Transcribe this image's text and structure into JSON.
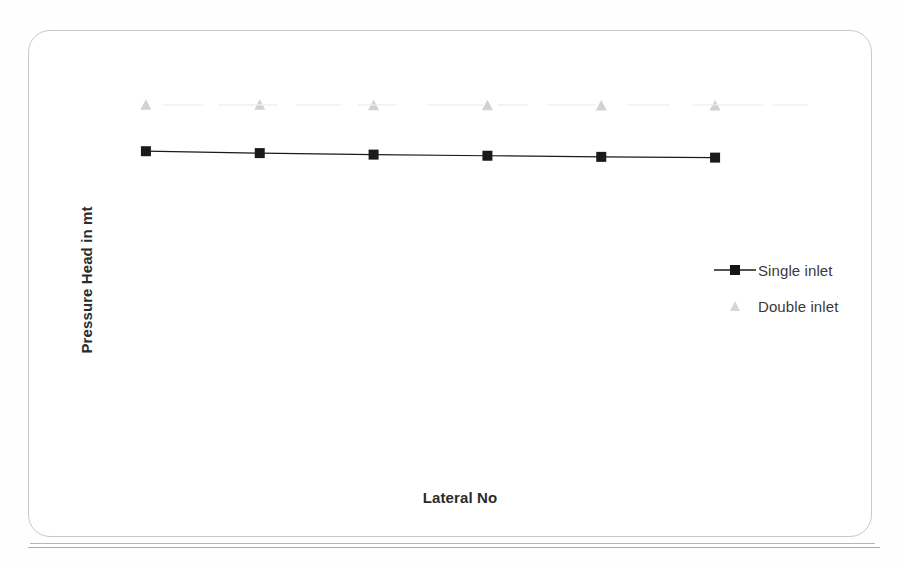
{
  "figure": {
    "frame_color": "#c9c9cb",
    "background": "#ffffff"
  },
  "chart_data": {
    "type": "line",
    "title": "",
    "subtitle": "",
    "xlabel": "Lateral No",
    "ylabel": "Pressure Head in mt",
    "categories": [
      "1",
      "2",
      "3",
      "4",
      "5",
      "6"
    ],
    "xlim": [
      0.5,
      6.5
    ],
    "ylim": [
      0,
      10
    ],
    "grid": false,
    "axis_ticks_visible": false,
    "tick_labels_visible": false,
    "legend_position": "right",
    "series": [
      {
        "name": "Single inlet",
        "marker": "square",
        "color": "#1a1a1a",
        "line": true,
        "values": [
          7.05,
          7.0,
          6.96,
          6.93,
          6.9,
          6.88
        ]
      },
      {
        "name": "Double inlet",
        "marker": "triangle",
        "color": "#d2d2d4",
        "line": false,
        "values": [
          8.28,
          8.28,
          8.27,
          8.27,
          8.26,
          8.26
        ]
      }
    ]
  },
  "legend": {
    "entries": [
      {
        "label": "Single inlet",
        "marker": "square-with-line-icon"
      },
      {
        "label": "Double inlet",
        "marker": "triangle-icon"
      }
    ]
  },
  "axes": {
    "y_title": "Pressure Head in mt",
    "x_title": "Lateral No"
  }
}
